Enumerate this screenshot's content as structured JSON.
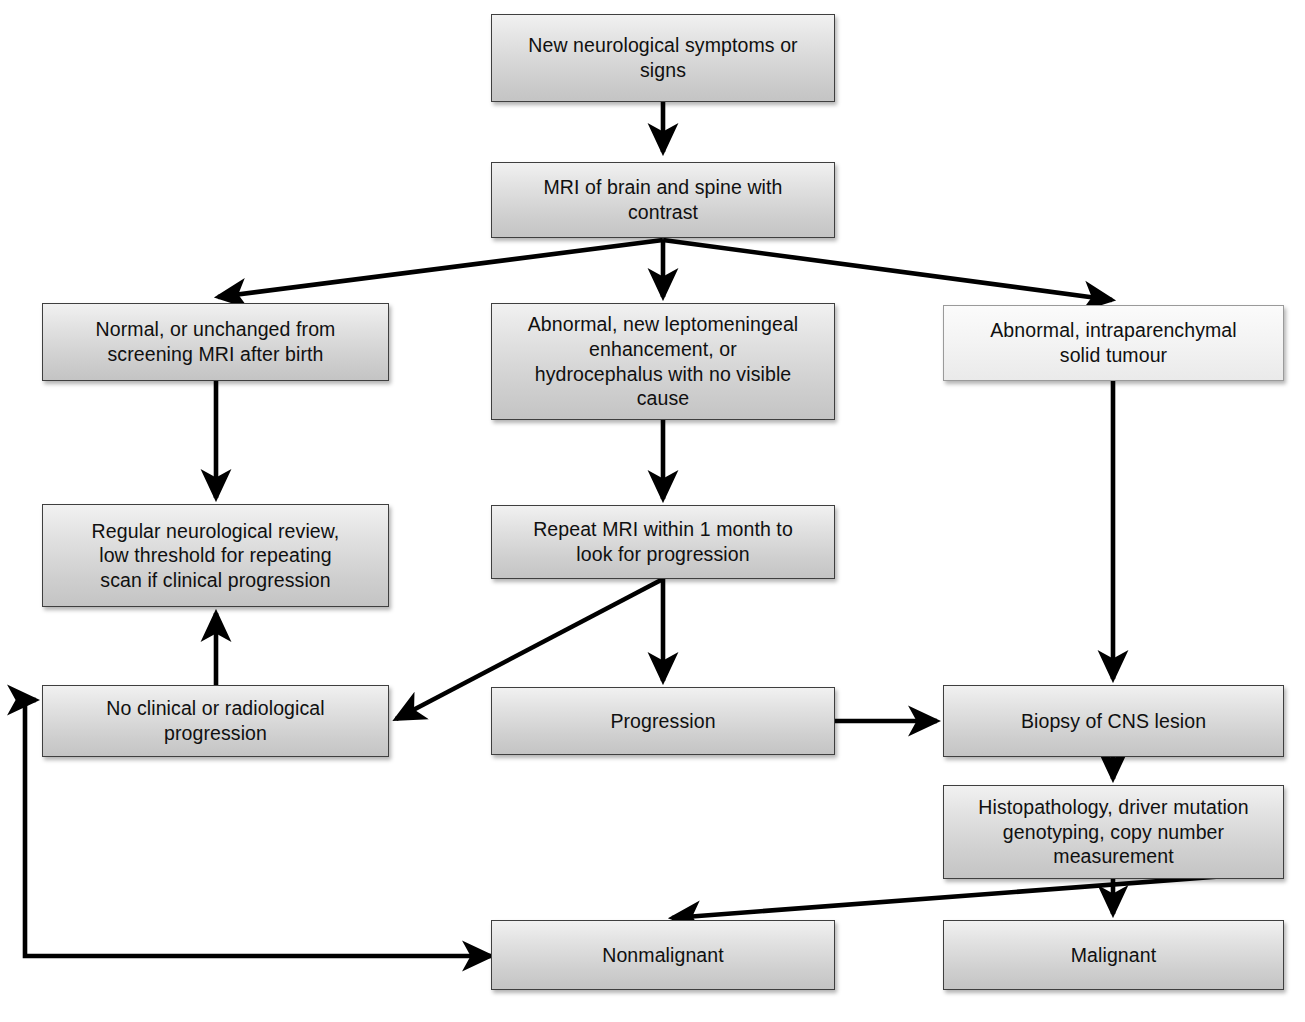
{
  "diagram": {
    "background_color": "#ffffff",
    "box_fill_dark": "#cfcfcf",
    "box_fill_light": "#f4f4f4",
    "box_border_color": "#3f3f3f",
    "connector_color": "#000000",
    "text_color": "#101010"
  },
  "nodes": [
    {
      "id": "symptoms",
      "label": "New neurological symptoms or\nsigns",
      "x": 491,
      "y": 14,
      "w": 344,
      "h": 88,
      "style": "dark"
    },
    {
      "id": "mri",
      "label": "MRI of brain and spine with\ncontrast",
      "x": 491,
      "y": 162,
      "w": 344,
      "h": 76,
      "style": "dark"
    },
    {
      "id": "normal",
      "label": "Normal, or unchanged from\nscreening MRI after birth",
      "x": 42,
      "y": 303,
      "w": 347,
      "h": 78,
      "style": "dark"
    },
    {
      "id": "leptomeningeal",
      "label": "Abnormal, new leptomeningeal\nenhancement, or\nhydrocephalus with no visible\ncause",
      "x": 491,
      "y": 303,
      "w": 344,
      "h": 117,
      "style": "dark"
    },
    {
      "id": "solidtumour",
      "label": "Abnormal, intraparenchymal\nsolid tumour",
      "x": 943,
      "y": 305,
      "w": 341,
      "h": 76,
      "style": "light"
    },
    {
      "id": "review",
      "label": "Regular neurological review,\nlow threshold for repeating\nscan if clinical progression",
      "x": 42,
      "y": 504,
      "w": 347,
      "h": 103,
      "style": "dark"
    },
    {
      "id": "repeat",
      "label": "Repeat MRI within 1 month to\nlook for progression",
      "x": 491,
      "y": 505,
      "w": 344,
      "h": 74,
      "style": "dark"
    },
    {
      "id": "noprogression",
      "label": "No clinical or radiological\nprogression",
      "x": 42,
      "y": 685,
      "w": 347,
      "h": 72,
      "style": "dark"
    },
    {
      "id": "progression",
      "label": "Progression",
      "x": 491,
      "y": 687,
      "w": 344,
      "h": 68,
      "style": "dark"
    },
    {
      "id": "biopsy",
      "label": "Biopsy of CNS lesion",
      "x": 943,
      "y": 685,
      "w": 341,
      "h": 72,
      "style": "dark"
    },
    {
      "id": "histopathology",
      "label": "Histopathology, driver mutation\ngenotyping, copy number\nmeasurement",
      "x": 943,
      "y": 785,
      "w": 341,
      "h": 94,
      "style": "dark"
    },
    {
      "id": "nonmalignant",
      "label": "Nonmalignant",
      "x": 491,
      "y": 920,
      "w": 344,
      "h": 70,
      "style": "dark"
    },
    {
      "id": "malignant",
      "label": "Malignant",
      "x": 943,
      "y": 920,
      "w": 341,
      "h": 70,
      "style": "dark"
    }
  ],
  "edges": [
    {
      "id": "symptoms-to-mri",
      "from": "symptoms",
      "to": "mri",
      "points": "663,102 663,152",
      "arrow": "end"
    },
    {
      "id": "mri-to-normal",
      "from": "mri",
      "to": "normal",
      "points": "663,240 218,297",
      "arrow": "end"
    },
    {
      "id": "mri-to-leptomeningeal",
      "from": "mri",
      "to": "leptomeningeal",
      "points": "663,240 663,297",
      "arrow": "end"
    },
    {
      "id": "mri-to-solidtumour",
      "from": "mri",
      "to": "solidtumour",
      "points": "663,240 1112,300",
      "arrow": "end"
    },
    {
      "id": "normal-to-review",
      "from": "normal",
      "to": "review",
      "points": "216,381 216,498",
      "arrow": "end"
    },
    {
      "id": "leptomeningeal-to-repeat",
      "from": "leptomeningeal",
      "to": "repeat",
      "points": "663,420 663,499",
      "arrow": "end"
    },
    {
      "id": "repeat-to-progression",
      "from": "repeat",
      "to": "progression",
      "points": "663,579 663,681",
      "arrow": "end"
    },
    {
      "id": "repeat-to-noprogression",
      "from": "repeat",
      "to": "noprogression",
      "points": "663,579 396,719",
      "arrow": "end"
    },
    {
      "id": "noprogression-to-review",
      "from": "noprogression",
      "to": "review",
      "points": "216,685 216,613",
      "arrow": "end"
    },
    {
      "id": "progression-to-biopsy",
      "from": "progression",
      "to": "biopsy",
      "points": "835,721 937,721",
      "arrow": "end"
    },
    {
      "id": "solidtumour-to-biopsy",
      "from": "solidtumour",
      "to": "biopsy",
      "points": "1113,381 1113,679",
      "arrow": "end"
    },
    {
      "id": "biopsy-to-histopathology",
      "from": "biopsy",
      "to": "histopathology",
      "points": "1113,757 1113,779",
      "arrow": "end"
    },
    {
      "id": "histopathology-to-malignant",
      "from": "histopathology",
      "to": "malignant",
      "points": "1113,879 1113,914",
      "arrow": "end"
    },
    {
      "id": "histopathology-to-nonmalignant",
      "from": "histopathology",
      "to": "nonmalignant",
      "points": "1278,872 672,918",
      "arrow": "end"
    },
    {
      "id": "nonmalignant-to-noprogression",
      "from": "nonmalignant",
      "to": "noprogression",
      "points": "491,956 25,956 25,700 36,700",
      "arrow": "both"
    }
  ]
}
